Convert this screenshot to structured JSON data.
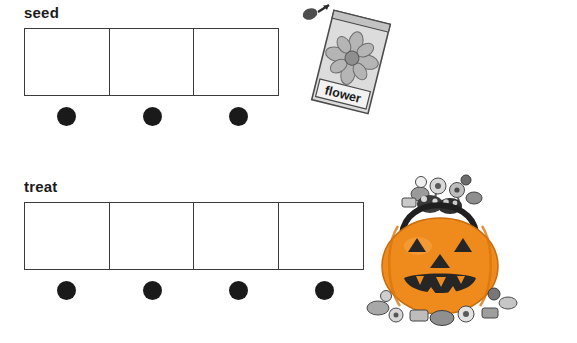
{
  "page": {
    "background_color": "#ffffff",
    "width": 577,
    "height": 343
  },
  "rows": [
    {
      "id": "seed",
      "label": "seed",
      "box_count": 3,
      "dot_count": 3,
      "dot_color": "#1a1a1a",
      "box_border_color": "#3b3b3b",
      "illustration": "seed-packet"
    },
    {
      "id": "treat",
      "label": "treat",
      "box_count": 4,
      "dot_count": 4,
      "dot_color": "#1a1a1a",
      "box_border_color": "#3b3b3b",
      "illustration": "pumpkin-candy-bucket"
    }
  ],
  "illustrations": {
    "seed_packet": {
      "name": "seed-packet",
      "text": "flower",
      "packet_color": "#d8d8d8",
      "flower_color": "#b3b3b3"
    },
    "pumpkin": {
      "name": "pumpkin-candy-bucket",
      "body_color": "#f08a1e",
      "face_color": "#2b2b2b"
    }
  }
}
